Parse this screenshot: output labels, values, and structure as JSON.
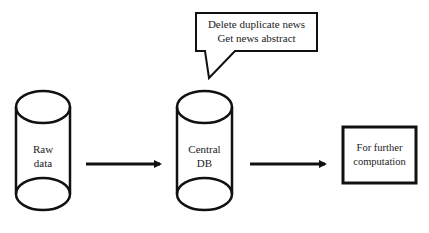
{
  "diagram": {
    "nodes": [
      {
        "id": "raw-data",
        "shape": "cylinder",
        "lines": [
          "Raw",
          "data"
        ]
      },
      {
        "id": "central-db",
        "shape": "cylinder",
        "lines": [
          "Central",
          "DB"
        ]
      },
      {
        "id": "further-computation",
        "shape": "rectangle",
        "lines": [
          "For further",
          "computation"
        ]
      }
    ],
    "edges": [
      {
        "from": "raw-data",
        "to": "central-db"
      },
      {
        "from": "central-db",
        "to": "further-computation"
      }
    ],
    "callout": {
      "attached_to": "central-db",
      "lines": [
        "Delete duplicate news",
        "Get news abstract"
      ]
    },
    "colors": {
      "stroke": "#111111",
      "background": "#ffffff",
      "text": "#222222"
    }
  }
}
